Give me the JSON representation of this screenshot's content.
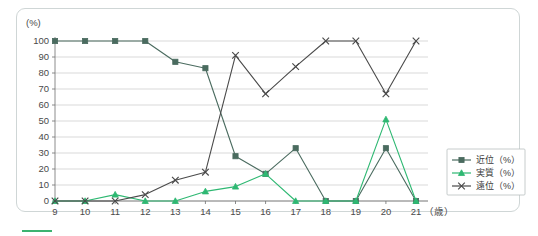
{
  "figure": {
    "y_axis_unit": "(%)",
    "x_axis_unit": "（歳）"
  },
  "legend": {
    "items": [
      {
        "label": "近位（%）",
        "color": "#4a6b5f",
        "marker": "square"
      },
      {
        "label": "実質（%）",
        "color": "#2eb872",
        "marker": "triangle"
      },
      {
        "label": "遠位（%）",
        "color": "#4a4a4a",
        "marker": "cross"
      }
    ]
  },
  "chart_data": {
    "type": "line",
    "title": "",
    "xlabel": "（歳）",
    "ylabel": "(%)",
    "xlim": [
      9,
      21
    ],
    "ylim": [
      0,
      100
    ],
    "grid": true,
    "legend_position": "right",
    "x": [
      9,
      10,
      11,
      12,
      13,
      14,
      15,
      16,
      17,
      18,
      19,
      20,
      21
    ],
    "xtick_labels": [
      "9",
      "10",
      "11",
      "12",
      "13",
      "14",
      "15",
      "16",
      "17",
      "18",
      "19",
      "20",
      "21"
    ],
    "ytick_labels": [
      "0",
      "10",
      "20",
      "30",
      "40",
      "50",
      "60",
      "70",
      "80",
      "90",
      "100"
    ],
    "series": [
      {
        "name": "近位（%）",
        "color": "#4a6b5f",
        "marker": "square",
        "values": [
          100,
          100,
          100,
          100,
          87,
          83,
          28,
          17,
          33,
          0,
          0,
          33,
          0
        ]
      },
      {
        "name": "実質（%）",
        "color": "#2eb872",
        "marker": "triangle",
        "values": [
          0,
          0,
          4,
          0,
          0,
          6,
          9,
          17,
          0,
          0,
          0,
          51,
          0
        ]
      },
      {
        "name": "遠位（%）",
        "color": "#4a4a4a",
        "marker": "cross",
        "values": [
          0,
          0,
          0,
          4,
          13,
          18,
          91,
          67,
          84,
          100,
          100,
          67,
          100
        ]
      }
    ]
  }
}
